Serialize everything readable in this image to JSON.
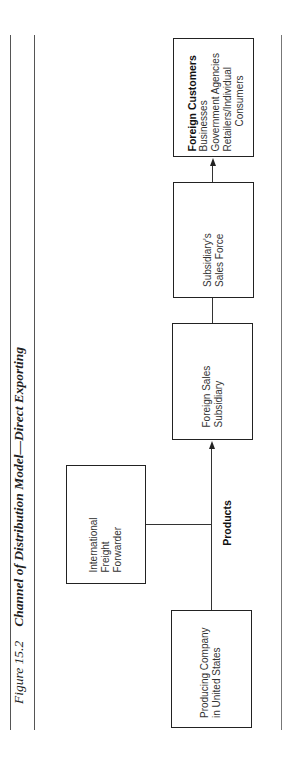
{
  "figure": {
    "number": "Figure 15.2",
    "caption": "Channel of Distribution Model—Direct Exporting"
  },
  "nodes": {
    "producing_company": {
      "lines": [
        "Producing Company",
        "in United States"
      ]
    },
    "freight_forwarder": {
      "lines": [
        "International",
        "Freight",
        "Forwarder"
      ]
    },
    "foreign_sales_subsidiary": {
      "lines": [
        "Foreign Sales",
        "Subsidiary"
      ]
    },
    "subsidiary_sales_force": {
      "lines": [
        "Subsidiary’s",
        "Sales Force"
      ]
    },
    "foreign_customers": {
      "title": "Foreign Customers",
      "lines": [
        "Businesses",
        "Government Agencies",
        "Retailers/Individual",
        "Consumers"
      ]
    }
  },
  "edges": {
    "products_label": "Products"
  },
  "colors": {
    "border": "#222222",
    "text": "#333333",
    "rule": "#555555"
  }
}
